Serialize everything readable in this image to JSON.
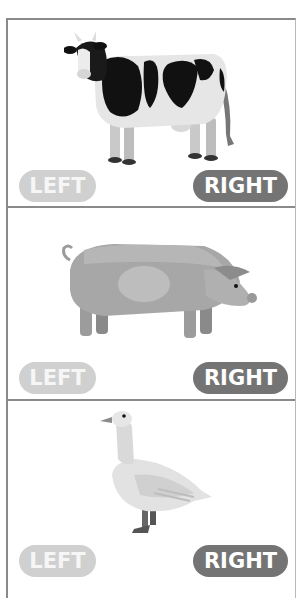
{
  "panels": [
    {
      "animal": "cow",
      "animal_icon": "cow-illustration",
      "left_label": "LEFT",
      "right_label": "RIGHT"
    },
    {
      "animal": "pig",
      "animal_icon": "pig-illustration",
      "left_label": "LEFT",
      "right_label": "RIGHT"
    },
    {
      "animal": "goose",
      "animal_icon": "goose-illustration",
      "left_label": "LEFT",
      "right_label": "RIGHT"
    }
  ],
  "colors": {
    "border": "#8a8a8a",
    "left_button": "#d0d0d0",
    "right_button": "#747474",
    "button_text": "#ffffff",
    "background": "#ffffff"
  }
}
